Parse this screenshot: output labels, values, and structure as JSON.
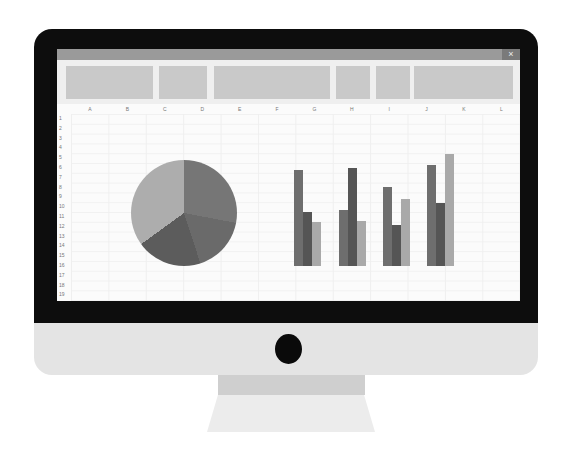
{
  "window": {
    "close_icon": "×",
    "ribbon_blocks": [
      {
        "left": 9,
        "width": 87
      },
      {
        "left": 102,
        "width": 48
      },
      {
        "left": 157,
        "width": 116
      },
      {
        "left": 279,
        "width": 34
      },
      {
        "left": 319,
        "width": 34
      },
      {
        "left": 357,
        "width": 99
      }
    ]
  },
  "sheet": {
    "columns": [
      "A",
      "B",
      "C",
      "D",
      "E",
      "F",
      "G",
      "H",
      "I",
      "J",
      "K",
      "L"
    ],
    "rows": [
      "1",
      "2",
      "3",
      "4",
      "5",
      "6",
      "7",
      "8",
      "9",
      "10",
      "11",
      "12",
      "13",
      "14",
      "15",
      "16",
      "17",
      "18",
      "19"
    ]
  },
  "colors": {
    "bezel": "#0d0d0d",
    "chin": "#e4e4e4",
    "series": [
      "#6e6e6e",
      "#555555",
      "#a9a9a9"
    ],
    "pie": [
      "#767676",
      "#6a6a6a",
      "#5c5c5c",
      "#adadad"
    ]
  },
  "chart_data": [
    {
      "type": "pie",
      "title": "",
      "categories": [
        "Slice 1",
        "Slice 2",
        "Slice 3",
        "Slice 4"
      ],
      "values": [
        28,
        17,
        20,
        35
      ],
      "note": "unlabeled grayscale pie; values estimated from angles (percent)"
    },
    {
      "type": "bar",
      "title": "",
      "categories": [
        "Group 1",
        "Group 2",
        "Group 3",
        "Group 4"
      ],
      "series": [
        {
          "name": "Series 1",
          "values": [
            96,
            56,
            79,
            101
          ]
        },
        {
          "name": "Series 2",
          "values": [
            54,
            98,
            41,
            63
          ]
        },
        {
          "name": "Series 3",
          "values": [
            44,
            45,
            67,
            112
          ]
        }
      ],
      "xlabel": "",
      "ylabel": "",
      "note": "unlabeled bars; values are relative heights in pixels from baseline"
    }
  ]
}
